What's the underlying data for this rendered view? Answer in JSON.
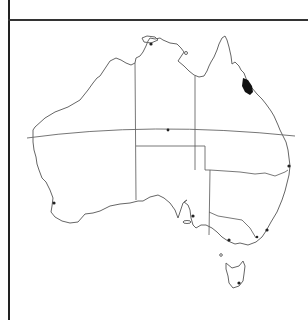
{
  "map": {
    "region": "Australia",
    "features": {
      "coastline": "outline of mainland Australia and Tasmania",
      "state_borders": [
        "WA",
        "NT",
        "SA",
        "QLD",
        "NSW",
        "VIC",
        "TAS"
      ],
      "tropic_line": "Tropic of Capricorn",
      "distribution_area": {
        "location": "north-east Queensland coast",
        "color": "#111111"
      }
    },
    "markers": [
      {
        "name": "darwin-marker",
        "x": 151,
        "y": 44
      },
      {
        "name": "alice-springs-marker",
        "x": 168,
        "y": 130
      },
      {
        "name": "brisbane-marker",
        "x": 289,
        "y": 166
      },
      {
        "name": "perth-marker",
        "x": 54,
        "y": 203
      },
      {
        "name": "adelaide-marker",
        "x": 193,
        "y": 216
      },
      {
        "name": "sydney-marker",
        "x": 267,
        "y": 230
      },
      {
        "name": "canberra-marker",
        "x": 257,
        "y": 237
      },
      {
        "name": "melbourne-marker",
        "x": 229,
        "y": 240
      },
      {
        "name": "hobart-marker",
        "x": 239,
        "y": 283
      }
    ],
    "colors": {
      "line": "#666666",
      "frame": "#222222",
      "fill": "#111111"
    }
  }
}
